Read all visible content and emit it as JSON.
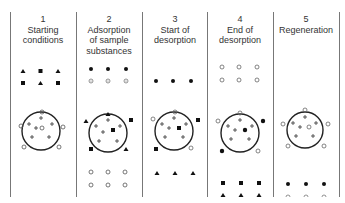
{
  "diagram": {
    "stages": [
      {
        "number": "1",
        "label": "Starting conditions",
        "lines": [
          "Starting",
          "conditions"
        ]
      },
      {
        "number": "2",
        "label": "Adsorption of sample substances",
        "lines": [
          "Adsorption",
          "of sample",
          "substances"
        ]
      },
      {
        "number": "3",
        "label": "Start of desorption",
        "lines": [
          "Start of",
          "desorption"
        ]
      },
      {
        "number": "4",
        "label": "End of desorption",
        "lines": [
          "End of",
          "desorption"
        ]
      },
      {
        "number": "5",
        "label": "Regeneration",
        "lines": [
          "Regeneration"
        ]
      }
    ],
    "legend_symbols": {
      "open-circle": "solvent molecule",
      "dotted-circle": "solvent molecule",
      "filled-circle": "sample substance",
      "filled-square": "sample substance",
      "filled-triangle": "sample substance",
      "plus": "adsorption site"
    }
  }
}
